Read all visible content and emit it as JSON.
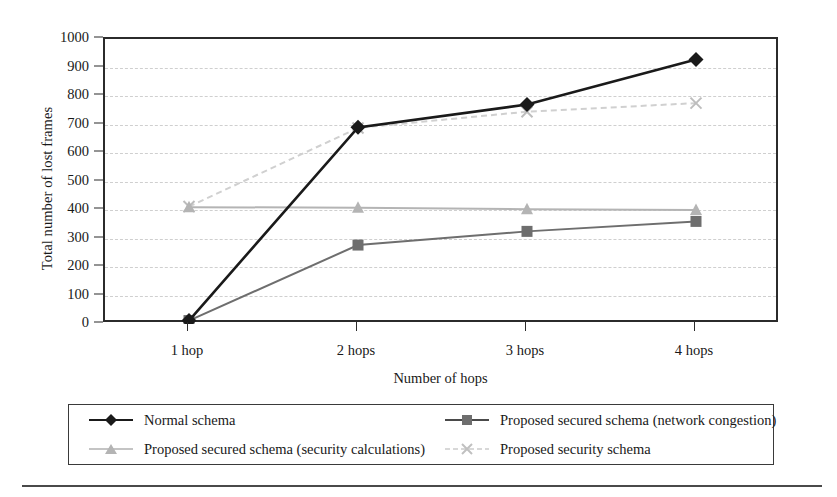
{
  "chart_data": {
    "type": "line",
    "title": "",
    "xlabel": "Number of hops",
    "ylabel": "Total number of lost frames",
    "categories": [
      "1 hop",
      "2 hops",
      "3 hops",
      "4 hops"
    ],
    "ylim": [
      0,
      1000
    ],
    "yticks": [
      0,
      100,
      200,
      300,
      400,
      500,
      600,
      700,
      800,
      900,
      1000
    ],
    "grid": true,
    "legend_position": "below-axes",
    "series": [
      {
        "name": "Normal schema",
        "values": [
          12,
          690,
          770,
          928
        ],
        "color": "#1a1a1a",
        "marker": "diamond",
        "linestyle": "solid"
      },
      {
        "name": "Proposed secured schema (network congestion)",
        "values": [
          12,
          277,
          325,
          360
        ],
        "color": "#6e6e6e",
        "marker": "square",
        "linestyle": "solid"
      },
      {
        "name": "Proposed secured schema (security calculations)",
        "values": [
          410,
          408,
          403,
          400
        ],
        "color": "#b4b4b4",
        "marker": "triangle",
        "linestyle": "solid"
      },
      {
        "name": "Proposed security schema",
        "values": [
          412,
          688,
          745,
          775
        ],
        "color": "#d0d0d0",
        "marker": "cross",
        "linestyle": "dashed"
      }
    ]
  },
  "axes": {
    "y_title": "Total number of lost frames",
    "x_title": "Number of hops",
    "y_tick_labels": [
      "1000",
      "900",
      "800",
      "700",
      "600",
      "500",
      "400",
      "300",
      "200",
      "100",
      "0"
    ],
    "x_tick_labels": [
      "1 hop",
      "2 hops",
      "3 hops",
      "4 hops"
    ]
  },
  "legend": {
    "entries": [
      {
        "label": "Normal schema",
        "marker": "diamond-marker-icon",
        "color": "#1a1a1a"
      },
      {
        "label": "Proposed secured schema (network congestion)",
        "marker": "square-marker-icon",
        "color": "#6e6e6e"
      },
      {
        "label": "Proposed secured schema (security calculations)",
        "marker": "triangle-marker-icon",
        "color": "#b4b4b4"
      },
      {
        "label": "Proposed security schema",
        "marker": "cross-marker-icon",
        "color": "#d0d0d0"
      }
    ]
  }
}
